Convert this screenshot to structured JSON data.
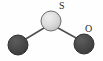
{
  "figure": {
    "background_color": "#fefefe",
    "width": 103,
    "height": 61
  },
  "labels": {
    "sulfur": "S",
    "oxygen": "O",
    "label_color": "#2a2a2a"
  },
  "atoms": [
    {
      "id": "center-atom",
      "element": "S",
      "cx": 51,
      "cy": 21,
      "r": 10,
      "fill": "#d4d4d4",
      "stroke": "#6e6e6e",
      "style": "light-sphere"
    },
    {
      "id": "left-atom",
      "element": "O",
      "cx": 18,
      "cy": 45,
      "r": 10,
      "fill": "#4a4a4a",
      "stroke": "#2e2e2e",
      "style": "dark-sphere"
    },
    {
      "id": "right-atom",
      "element": "O",
      "cx": 84,
      "cy": 44,
      "r": 10,
      "fill": "#4a4a4a",
      "stroke": "#2e2e2e",
      "style": "dark-sphere"
    }
  ],
  "bonds": [
    {
      "id": "bond-left",
      "from": "center-atom",
      "to": "left-atom",
      "x1": 44,
      "y1": 28,
      "x2": 24,
      "y2": 40,
      "color": "#4f4f4f",
      "width": 1.6
    },
    {
      "id": "bond-right",
      "from": "center-atom",
      "to": "right-atom",
      "x1": 58,
      "y1": 28,
      "x2": 78,
      "y2": 39,
      "color": "#4f4f4f",
      "width": 1.6
    }
  ],
  "colors": {
    "sphere_light": "#d4d4d4",
    "sphere_dark": "#4a4a4a",
    "bond": "#4f4f4f",
    "text": "#2a2a2a",
    "background": "#fefefe"
  }
}
